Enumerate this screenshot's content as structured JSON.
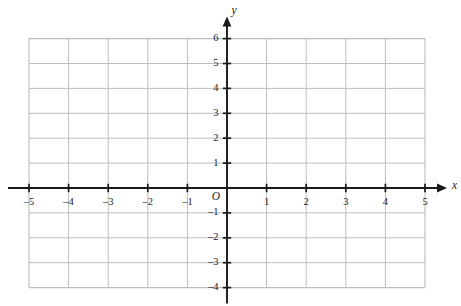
{
  "chart_data": {
    "type": "scatter",
    "title": "",
    "subtitle": "",
    "xlabel": "x",
    "ylabel": "y",
    "origin_label": "O",
    "xlim": [
      -5,
      5
    ],
    "ylim": [
      -4,
      6
    ],
    "x_ticks": [
      -5,
      -4,
      -3,
      -2,
      -1,
      1,
      2,
      3,
      4,
      5
    ],
    "y_ticks": [
      -4,
      -3,
      -2,
      -1,
      1,
      2,
      3,
      4,
      5,
      6
    ],
    "x_tick_labels": [
      "–5",
      "–4",
      "–3",
      "–2",
      "–1",
      "1",
      "2",
      "3",
      "4",
      "5"
    ],
    "y_tick_labels": [
      "–4",
      "–3",
      "–2",
      "–1",
      "1",
      "2",
      "3",
      "4",
      "5",
      "6"
    ],
    "grid": true,
    "grid_step_x": 1,
    "grid_step_y": 1,
    "legend": "none",
    "series": [],
    "annotations": [],
    "axis_arrows": [
      "x-positive",
      "y-positive"
    ],
    "colors": {
      "grid": "#bdbdbd",
      "axis": "#1a1a1a",
      "background": "#ffffff",
      "text": "#1a1a1a"
    }
  },
  "figure": {
    "name": "blank-cartesian-coordinate-grid"
  }
}
